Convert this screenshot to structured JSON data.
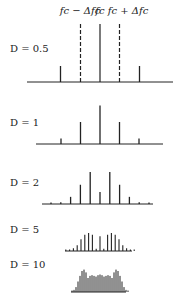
{
  "header_labels": {
    "lower": "fc − Δfc",
    "center": "fc",
    "upper": "fc + Δfc"
  },
  "chart_data": {
    "type": "bar",
    "center_frequency_label": "fc",
    "deviation_markers": [
      "fc - Δfc",
      "fc + Δfc"
    ],
    "panels": [
      {
        "label": "D = 0.5",
        "harmonic_offsets": [
          -2,
          -1,
          0,
          1,
          2
        ],
        "amplitudes": [
          0.03,
          0.24,
          0.94,
          0.24,
          0.03
        ]
      },
      {
        "label": "D = 1",
        "harmonic_offsets": [
          -2,
          -1,
          0,
          1,
          2
        ],
        "amplitudes": [
          0.11,
          0.44,
          0.77,
          0.44,
          0.11
        ]
      },
      {
        "label": "D = 2",
        "harmonic_offsets": [
          -5,
          -4,
          -3,
          -2,
          -1,
          0,
          1,
          2,
          3,
          4,
          5
        ],
        "amplitudes": [
          0.02,
          0.03,
          0.13,
          0.35,
          0.58,
          0.22,
          0.58,
          0.35,
          0.13,
          0.03,
          0.02
        ]
      },
      {
        "label": "D = 5",
        "harmonic_offsets": [
          -9,
          -8,
          -7,
          -6,
          -5,
          -4,
          -3,
          -2,
          -1,
          0,
          1,
          2,
          3,
          4,
          5,
          6,
          7,
          8,
          9
        ],
        "amplitudes": [
          0.01,
          0.02,
          0.06,
          0.13,
          0.26,
          0.36,
          0.4,
          0.36,
          0.05,
          0.33,
          0.05,
          0.36,
          0.4,
          0.36,
          0.26,
          0.13,
          0.06,
          0.02,
          0.01
        ]
      },
      {
        "label": "D = 10",
        "harmonic_offsets": [
          -14,
          -13,
          -12,
          -11,
          -10,
          -9,
          -8,
          -7,
          -6,
          -5,
          -4,
          -3,
          -2,
          -1,
          0,
          1,
          2,
          3,
          4,
          5,
          6,
          7,
          8,
          9,
          10,
          11,
          12,
          13,
          14
        ],
        "amplitudes": [
          0.01,
          0.03,
          0.07,
          0.15,
          0.23,
          0.3,
          0.32,
          0.28,
          0.2,
          0.23,
          0.24,
          0.23,
          0.22,
          0.24,
          0.25,
          0.24,
          0.22,
          0.23,
          0.24,
          0.23,
          0.2,
          0.28,
          0.32,
          0.3,
          0.23,
          0.15,
          0.07,
          0.03,
          0.01
        ]
      }
    ]
  },
  "panels_layout": [
    {
      "label": "D = 0.5",
      "baseline_y": 82,
      "x0": 27,
      "x1": 173,
      "spacing": 19.5,
      "scale": 50
    },
    {
      "label": "D = 1",
      "baseline_y": 144,
      "x0": 36,
      "x1": 163,
      "spacing": 19.5,
      "scale": 50
    },
    {
      "label": "D = 2",
      "baseline_y": 204,
      "x0": 42,
      "x1": 153,
      "spacing": 9.8,
      "scale": 55
    },
    {
      "label": "D = 5",
      "baseline_y": 251,
      "x0": 65,
      "x1": 132,
      "spacing": 3.8,
      "scale": 45
    },
    {
      "label": "D = 10",
      "baseline_y": 294,
      "x0": 71,
      "x1": 126,
      "spacing": 2.0,
      "scale": 70
    }
  ]
}
